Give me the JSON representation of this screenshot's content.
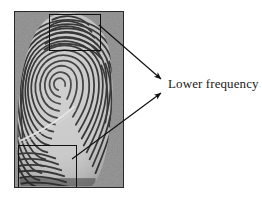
{
  "figure": {
    "type": "annotated-image",
    "background_color": "#ffffff",
    "width": 262,
    "height": 198
  },
  "fingerprint": {
    "name": "fingerprint-image",
    "description": "Grayscale fingerprint impression with loop core pattern",
    "frame_color": "#2a2a2a",
    "background_color": "#8b8b8b",
    "ridge_color": "#141414",
    "valley_color": "#c8c8c8",
    "bounds": {
      "x": 14,
      "y": 11,
      "width": 110,
      "height": 177
    }
  },
  "regions": [
    {
      "name": "roi-upper",
      "label": "upper region of interest",
      "border_color": "#111111",
      "bounds": {
        "x": 48,
        "y": 13,
        "width": 52,
        "height": 37
      }
    },
    {
      "name": "roi-lower",
      "label": "lower region of interest",
      "border_color": "#111111",
      "bounds": {
        "x": 17,
        "y": 144,
        "width": 59,
        "height": 43
      }
    }
  ],
  "arrows": [
    {
      "name": "arrow-upper",
      "from": {
        "x": 99,
        "y": 25
      },
      "to": {
        "x": 163,
        "y": 80
      },
      "color": "#111111"
    },
    {
      "name": "arrow-lower",
      "from": {
        "x": 72,
        "y": 159
      },
      "to": {
        "x": 163,
        "y": 92
      },
      "color": "#111111"
    }
  ],
  "labels": {
    "lower_frequency": "Lower frequency"
  }
}
